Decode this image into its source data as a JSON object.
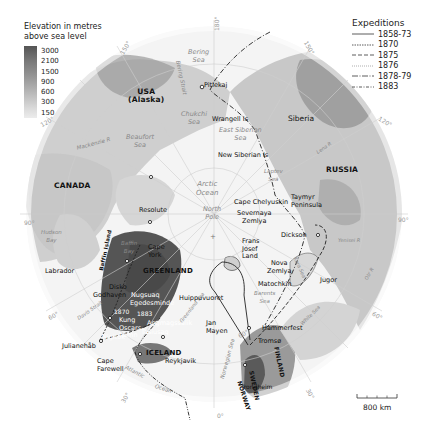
{
  "map": {
    "elevation_legend": {
      "title_line1": "Elevation in metres",
      "title_line2": "above sea level",
      "levels": [
        "3000",
        "2100",
        "1500",
        "900",
        "600",
        "300",
        "150"
      ]
    },
    "expeditions_legend": {
      "title": "Expeditions",
      "items": [
        {
          "label": "1858-73",
          "style": "solid"
        },
        {
          "label": "1870",
          "style": "dotted"
        },
        {
          "label": "1875",
          "style": "dashed"
        },
        {
          "label": "1876",
          "style": "fine-dotted"
        },
        {
          "label": "1878-79",
          "style": "dash-dot"
        },
        {
          "label": "1883",
          "style": "dash-dot-dot"
        }
      ]
    },
    "countries": {
      "usa": "USA",
      "alaska": "(Alaska)",
      "canada": "CANADA",
      "greenland": "GREENLAND",
      "iceland": "ICELAND",
      "russia": "RUSSIA",
      "siberia": "Siberia",
      "norway": "NORWAY",
      "sweden": "SWEDEN",
      "finland": "FINLAND"
    },
    "seas": {
      "bering_sea_1": "Bering",
      "bering_sea_2": "Sea",
      "bering_strait": "Bering Strait",
      "chukchi_1": "Chukchi",
      "chukchi_2": "Sea",
      "east_siberian_1": "East Siberian",
      "east_siberian_2": "Sea",
      "laptev_1": "Laptev",
      "laptev_2": "Sea",
      "beaufort_1": "Beaufort",
      "beaufort_2": "Sea",
      "arctic_1": "Arctic",
      "arctic_2": "Ocean",
      "hudson_1": "Hudson",
      "hudson_2": "Bay",
      "baffin_1": "Baffin",
      "baffin_2": "Bay",
      "davis_strait": "Davis Strait",
      "greenland_sea": "Greenland Sea",
      "norwegian_sea": "Norwegian Sea",
      "barents_1": "Barents",
      "barents_2": "Sea",
      "kara_sea": "Kara Sea",
      "white_sea": "White Sea",
      "atlantic": "Atlantic",
      "ocean": "Ocean"
    },
    "rivers": {
      "mackenzie": "Mackenzie R",
      "lena": "Lena R",
      "yenisei": "Yenisei R",
      "ob": "Ob' R"
    },
    "places": {
      "pitlekaj": "Pitlekaj",
      "wrangell": "Wrangell Is",
      "new_siberian": "New Siberian Is",
      "north_pole_1": "North",
      "north_pole_2": "Pole",
      "cape_chelyuskin": "Cape Chelyuskin",
      "taymyr_1": "Taymyr",
      "taymyr_2": "Peninsula",
      "severnaya_1": "Severnaya",
      "severnaya_2": "Zemlya",
      "dickson": "Dickson",
      "frans_1": "Frans",
      "frans_2": "Josef",
      "frans_3": "Land",
      "nova_1": "Nova",
      "nova_2": "Zemlya",
      "matochkin": "Matochkin",
      "jugor": "Jugor",
      "resolute": "Resolute",
      "cape_york_1": "Cape",
      "cape_york_2": "York",
      "baffin_island": "Baffin Island",
      "labrador": "Labrador",
      "disko": "Disko",
      "godhaven": "Godhaven",
      "nugsuaq": "Nugsuaq",
      "egedesminde": "Egedesminde",
      "year_1870": "1870",
      "year_1883": "1883",
      "kung_1": "Kung",
      "kung_2": "Oscars",
      "kung_3": "hamn",
      "angmagssalik": "Angmagssalik",
      "tasiusaq": "Tasiusaq",
      "nigitok": "Nigitok",
      "julianehab": "Julianehåb",
      "cape_farewell_1": "Cape",
      "cape_farewell_2": "Farewell",
      "reykjavik": "Reykjavik",
      "huippuvuoret": "Huippuvuoret",
      "jan_mayen_1": "Jan",
      "jan_mayen_2": "Mayen",
      "hammerfest": "Hammerfest",
      "tromso": "Tromsø",
      "trondheim": "Trondheim"
    },
    "graticule": {
      "lon_180": "180°",
      "lon_150w": "150°",
      "lon_150e": "150°",
      "lon_120w": "120°",
      "lon_120e": "120°",
      "lon_90w": "90°",
      "lon_90e": "90°",
      "lon_60w": "60°",
      "lon_60e": "60°",
      "lon_30w": "30°",
      "lon_30e": "30°",
      "lon_0": "0°",
      "lat_60": "60°"
    },
    "scale_bar": {
      "label": "800 km"
    }
  }
}
